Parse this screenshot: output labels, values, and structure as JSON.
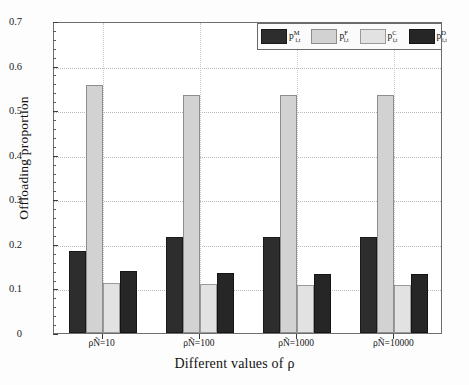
{
  "chart_data": {
    "type": "bar",
    "title": "",
    "xlabel": "Different values of ρ",
    "ylabel": "Offloading proportion",
    "categories": [
      "ρÑ=10",
      "ρÑ=100",
      "ρÑ=1000",
      "ρÑ=10000"
    ],
    "ylim": [
      0,
      0.7
    ],
    "yticks": [
      "0",
      "0.1",
      "0.2",
      "0.3",
      "0.4",
      "0.5",
      "0.6",
      "0.7"
    ],
    "ytick_values": [
      0,
      0.1,
      0.2,
      0.3,
      0.4,
      0.5,
      0.6,
      0.7
    ],
    "grid": true,
    "legend_position": "top-right",
    "series": [
      {
        "name": "p_{i,t}^{M}",
        "base": "p",
        "sup": "M",
        "sub": "i,t",
        "color": "#2d2d2d",
        "values": [
          0.185,
          0.215,
          0.216,
          0.215
        ]
      },
      {
        "name": "p_{i,t}^{F}",
        "base": "p",
        "sup": "F",
        "sub": "i,t",
        "color": "#d2d2d2",
        "values": [
          0.557,
          0.535,
          0.535,
          0.534
        ]
      },
      {
        "name": "p_{i,t}^{C}",
        "base": "p",
        "sup": "C",
        "sub": "i,t",
        "color": "#e2e2e2",
        "values": [
          0.112,
          0.109,
          0.108,
          0.107
        ]
      },
      {
        "name": "p_{i,t}^{D}",
        "base": "p",
        "sup": "D",
        "sub": "i,t",
        "color": "#262626",
        "values": [
          0.14,
          0.134,
          0.133,
          0.132
        ]
      }
    ]
  }
}
